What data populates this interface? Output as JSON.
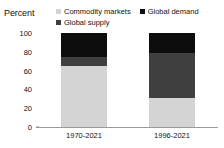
{
  "chart_data": {
    "type": "bar",
    "stacked": true,
    "title": "",
    "ylabel": "Percent",
    "xlabel": "",
    "ylim": [
      0,
      100
    ],
    "yticks": [
      0,
      20,
      40,
      60,
      80,
      100
    ],
    "grid": false,
    "legend_position": "top",
    "categories": [
      "1970-2021",
      "1996-2021"
    ],
    "series": [
      {
        "name": "Commodity markets",
        "color": "#d4d4d4",
        "values": [
          65,
          31
        ]
      },
      {
        "name": "Global supply",
        "color": "#3f3f3f",
        "values": [
          10,
          48
        ]
      },
      {
        "name": "Global demand",
        "color": "#0d0d0d",
        "values": [
          25,
          21
        ]
      }
    ]
  },
  "legend": {
    "items": [
      {
        "label": "Commodity markets",
        "color": "#d4d4d4"
      },
      {
        "label": "Global demand",
        "color": "#0d0d0d"
      },
      {
        "label": "Global supply",
        "color": "#3f3f3f"
      }
    ]
  },
  "axes": {
    "y_title": "Percent",
    "y_ticks": [
      "100",
      "80",
      "60",
      "40",
      "20",
      "0"
    ],
    "x_ticks": [
      "1970-2021",
      "1996-2021"
    ]
  }
}
